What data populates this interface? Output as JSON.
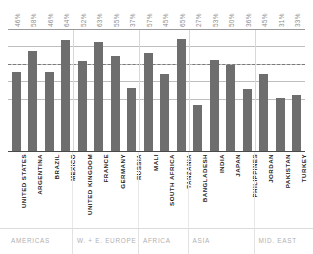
{
  "chart_data": {
    "type": "bar",
    "title": "",
    "subtitle": "",
    "xlabel": "",
    "ylabel": "",
    "ylim": [
      0,
      70
    ],
    "grid": true,
    "legend": "none",
    "gridline_values": [
      70,
      60,
      50,
      40,
      30
    ],
    "reference_line": {
      "value": 50,
      "style": "dashed"
    },
    "categories": [
      "UNITED STATES",
      "ARGENTINA",
      "BRAZIL",
      "MEXICO",
      "UNITED KINGDOM",
      "FRANCE",
      "GERMANY",
      "RUSSIA",
      "MALI",
      "SOUTH AFRICA",
      "TANZANIA",
      "BANGLADESH",
      "INDIA",
      "JAPAN",
      "PHILIPPINES",
      "JORDAN",
      "PAKISTAN",
      "TURKEY"
    ],
    "values": [
      46,
      58,
      46,
      64,
      52,
      63,
      55,
      37,
      57,
      45,
      65,
      27,
      53,
      50,
      36,
      45,
      31,
      33
    ],
    "value_labels": [
      "46%",
      "58%",
      "46%",
      "64%",
      "52%",
      "63%",
      "55%",
      "37%",
      "57%",
      "45%",
      "65%",
      "27%",
      "53%",
      "50%",
      "36%",
      "45%",
      "31%",
      "33%"
    ],
    "groups": [
      {
        "label": "AMERICAS",
        "start": 0,
        "count": 4
      },
      {
        "label": "W. + E. EUROPE",
        "start": 4,
        "count": 4
      },
      {
        "label": "AFRICA",
        "start": 8,
        "count": 3
      },
      {
        "label": "ASIA",
        "start": 11,
        "count": 4
      },
      {
        "label": "MID. EAST",
        "start": 15,
        "count": 3
      }
    ],
    "colors": {
      "bar": "#6e6e6e",
      "gridline": "#bfbfbf",
      "reference_line": "#7a7a7a",
      "baseline": "#4a4a4a",
      "value_label": "#8d8d8d",
      "category_label": "#1f1f1f",
      "group_label": "#b0b0b0",
      "background": "#ffffff"
    }
  }
}
